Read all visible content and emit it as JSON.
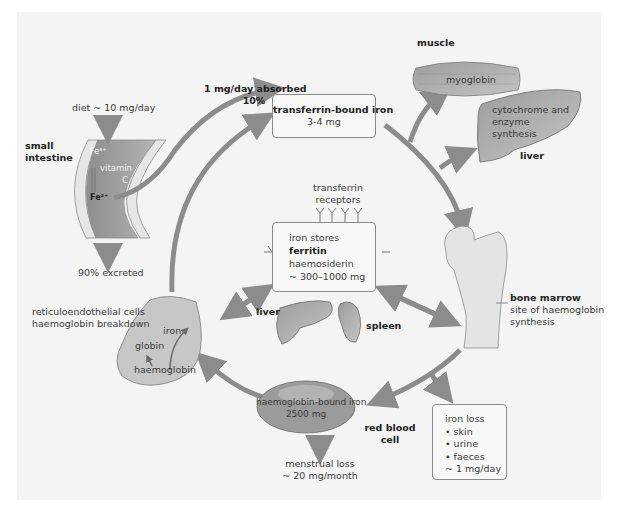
{
  "colors": {
    "background": "#f4f4f4",
    "arrow": "#8c8c8c",
    "organ_fill": "#a9a9a9",
    "cell_fill": "#c7c7c7",
    "box_border": "#8a8a8a"
  },
  "absorption": {
    "amount": "1 mg/day absorbed",
    "percent": "10%"
  },
  "diet": "diet ~ 10 mg/day",
  "small_intestine": {
    "label_line1": "small",
    "label_line2": "intestine",
    "fe3": "Fe³⁺",
    "vitamin_line1": "vitamin",
    "vitamin_line2": "C",
    "fe2": "Fe²⁺"
  },
  "excreted": "90% excreted",
  "transferrin": {
    "title": "transferrin-bound iron",
    "amount": "3-4 mg"
  },
  "muscle": {
    "label": "muscle",
    "content": "myoglobin"
  },
  "liver_synthesis": {
    "line1": "cytochrome and",
    "line2": "enzyme",
    "line3": "synthesis",
    "label": "liver"
  },
  "receptors": {
    "line1": "transferrin",
    "line2": "receptors"
  },
  "stores": {
    "line1": "iron stores",
    "line2": "ferritin",
    "line3": "haemosiderin",
    "line4": "~ 300–1000 mg"
  },
  "organs": {
    "liver": "liver",
    "spleen": "spleen"
  },
  "bone_marrow": {
    "title": "bone marrow",
    "line1": "site of haemoglobin",
    "line2": "synthesis"
  },
  "reticulo": {
    "line1": "reticuloendothelial cells",
    "line2": "haemoglobin breakdown",
    "iron": "iron",
    "globin": "globin",
    "haemoglobin": "haemoglobin"
  },
  "rbc": {
    "line1": "haemoglobin-bound iron",
    "line2": "2500 mg",
    "label_line1": "red blood",
    "label_line2": "cell"
  },
  "menstrual": {
    "line1": "menstrual loss",
    "line2": "~ 20 mg/month"
  },
  "iron_loss": {
    "title": "iron loss",
    "items": [
      "• skin",
      "• urine",
      "• faeces"
    ],
    "amount": "~ 1 mg/day"
  }
}
